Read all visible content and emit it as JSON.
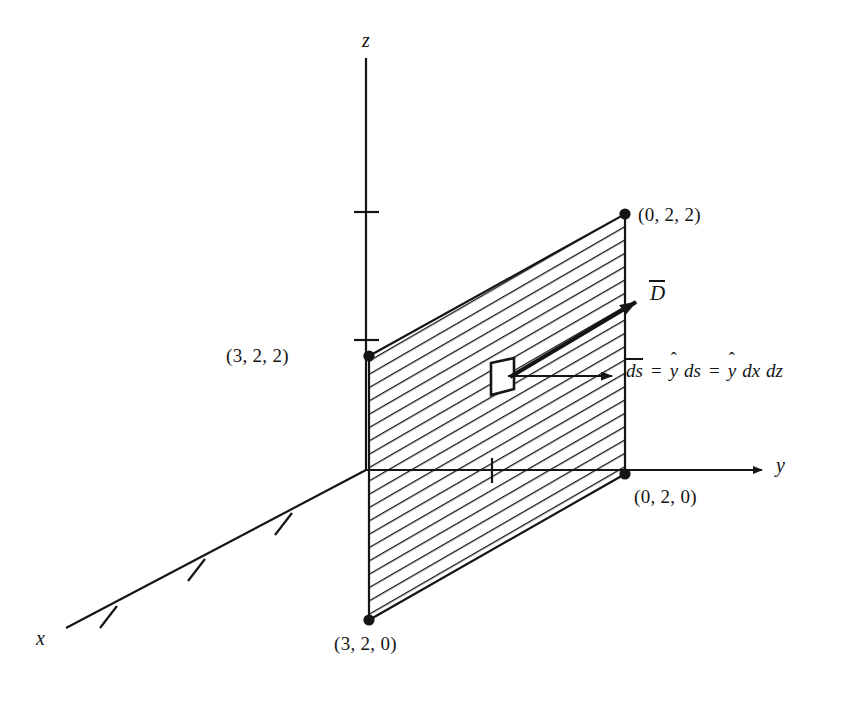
{
  "figure": {
    "background": "#ffffff",
    "stroke_color": "#151515",
    "axes": [
      {
        "name": "x-axis",
        "label": "x",
        "label_pos": [
          38,
          637
        ],
        "ticks": 3
      },
      {
        "name": "y-axis",
        "label": "y",
        "label_pos": [
          776,
          465
        ],
        "ticks": 1
      },
      {
        "name": "z-axis",
        "label": "z",
        "label_pos": [
          362,
          38
        ],
        "ticks": 2
      }
    ],
    "vertices": [
      {
        "name": "vertex-3-2-2",
        "label": "(3, 2, 2)",
        "point": [
          369,
          356
        ],
        "label_pos": [
          246,
          346
        ],
        "anchor": "right"
      },
      {
        "name": "vertex-0-2-2",
        "label": "(0, 2, 2)",
        "point": [
          625,
          214
        ],
        "label_pos": [
          637,
          204
        ],
        "anchor": "left"
      },
      {
        "name": "vertex-0-2-0",
        "label": "(0, 2, 0)",
        "point": [
          625,
          474
        ],
        "label_pos": [
          634,
          486
        ],
        "anchor": "left"
      },
      {
        "name": "vertex-3-2-0",
        "label": "(3, 2, 0)",
        "point": [
          369,
          620
        ],
        "label_pos": [
          334,
          634
        ],
        "anchor": "left"
      }
    ],
    "vector": {
      "name": "D-vector",
      "label": "D",
      "overbar": true,
      "label_pos": [
        651,
        285
      ],
      "tail": [
        512,
        376
      ],
      "head": [
        641,
        299
      ]
    },
    "ds_patch": {
      "name": "ds-patch",
      "fill": "#ffffff",
      "outline": "#151515"
    },
    "ds_equation": {
      "name": "ds-equation",
      "pos": [
        626,
        361
      ],
      "parts": [
        {
          "type": "vector",
          "text": "ds"
        },
        {
          "type": "op",
          "text": "="
        },
        {
          "type": "unit",
          "text": "y"
        },
        {
          "type": "var",
          "text": "ds"
        },
        {
          "type": "op",
          "text": "="
        },
        {
          "type": "unit",
          "text": "y"
        },
        {
          "type": "var",
          "text": "dx"
        },
        {
          "type": "var",
          "text": "dz"
        }
      ],
      "plain": "ds = y ds = y dx dz"
    },
    "hatching": {
      "name": "hatch-fill",
      "angle_deg": 30,
      "spacing_px": 10,
      "color": "#151515"
    }
  }
}
